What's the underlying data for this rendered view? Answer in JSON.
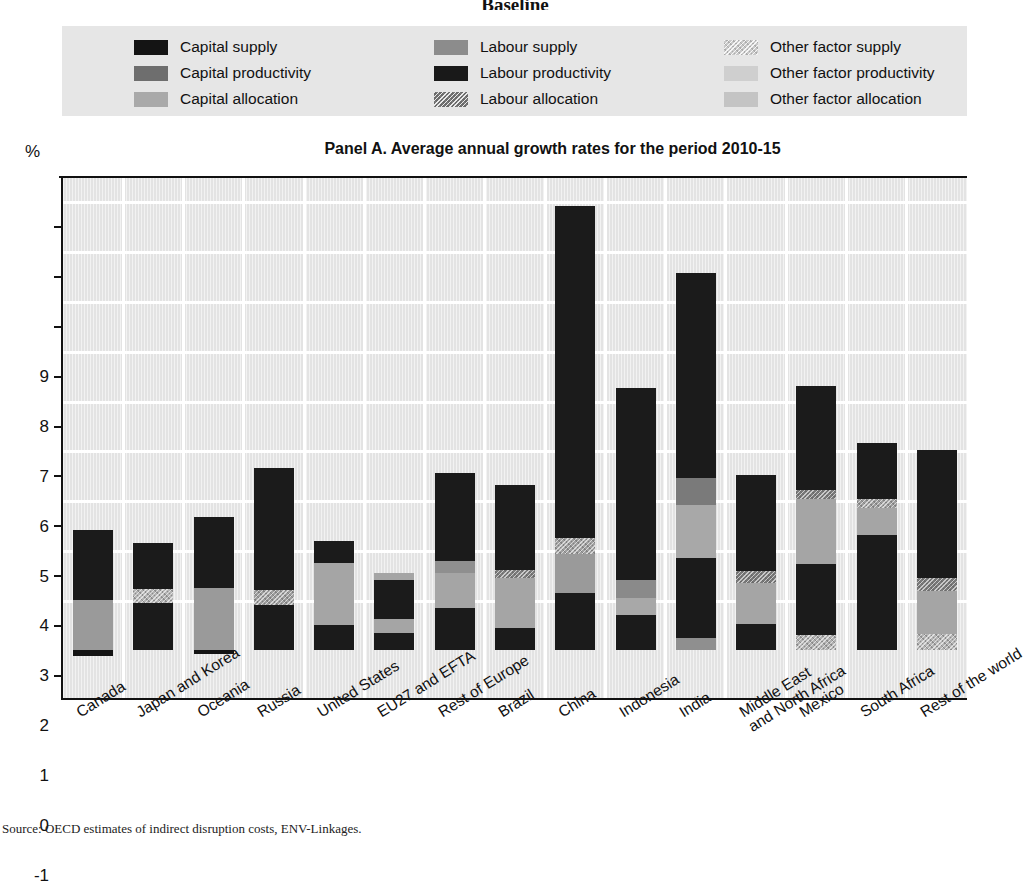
{
  "top_heading": "Baseline",
  "footer_note": "Source: OECD estimates of indirect disruption costs, ENV-Linkages.",
  "axis": {
    "unit_label": "%",
    "y_ticks": [
      9,
      8,
      7,
      6,
      5,
      4,
      3,
      2,
      1,
      0,
      -1
    ]
  },
  "legend": {
    "items": [
      {
        "label": "Capital supply",
        "color": "#141414",
        "texture": "none"
      },
      {
        "label": "Capital productivity",
        "color": "#6e6e6e",
        "texture": "none"
      },
      {
        "label": "Capital allocation",
        "color": "#a9a9a9",
        "texture": "none"
      },
      {
        "label": "Labour supply",
        "color": "#8c8c8c",
        "texture": "none"
      },
      {
        "label": "Labour productivity",
        "color": "#191919",
        "texture": "none"
      },
      {
        "label": "Labour allocation",
        "color": "#6b6b6b",
        "texture": "dots"
      },
      {
        "label": "Other factor supply",
        "color": "#c9c9c9",
        "texture": "dots"
      },
      {
        "label": "Other factor productivity",
        "color": "#cfcfcf",
        "texture": "none"
      },
      {
        "label": "Other factor allocation",
        "color": "#c4c4c4",
        "texture": "none"
      }
    ]
  },
  "chart_data": {
    "type": "bar",
    "stacked": true,
    "title": "Panel A. Average annual growth rates for the period 2010-15",
    "xlabel": "",
    "ylabel": "%",
    "ylim": [
      -1,
      9.5
    ],
    "ytick_step": 1,
    "grid": true,
    "legend_position": "top",
    "categories": [
      "Canada",
      "Japan and Korea",
      "Oceania",
      "Russia",
      "United States",
      "EU27 and EFTA",
      "Rest of Europe",
      "Brazil",
      "China",
      "Indonesia",
      "India",
      "Middle East\nand North Africa",
      "Mexico",
      "South Africa",
      "Rest of the world"
    ],
    "series": [
      {
        "name": "Capital supply",
        "values": [
          1.4,
          0.95,
          1.42,
          0.9,
          0.45,
          0.8,
          1.8,
          1.7,
          6.65,
          3.85,
          4.1,
          1.95,
          2.1,
          1.15,
          2.55
        ]
      },
      {
        "name": "Labour supply",
        "values": [
          1.0,
          0.25,
          1.25,
          0.0,
          1.25,
          0.25,
          0.9,
          1.0,
          1.05,
          0.4,
          1.05,
          0.85,
          1.3,
          0.55,
          0.8
        ]
      },
      {
        "name": "Other factor supply",
        "values": [
          -0.1,
          0.15,
          -0.07,
          0.3,
          0.0,
          0.0,
          0.0,
          0.15,
          0.3,
          0.0,
          0.55,
          0.2,
          0.3,
          0.15,
          0.35
        ]
      },
      {
        "name": "Labour productivity",
        "values": [
          0.0,
          1.05,
          0.0,
          2.45,
          1.75,
          0.35,
          0.85,
          0.45,
          1.15,
          0.7,
          1.6,
          0.5,
          1.45,
          2.3,
          1.45
        ]
      },
      {
        "name": "Capital productivity",
        "values": [
          0.0,
          0.0,
          0.0,
          0.0,
          0.0,
          0.0,
          0.0,
          0.0,
          0.0,
          0.3,
          0.0,
          0.0,
          0.0,
          0.0,
          0.0
        ]
      },
      {
        "name": "Other factor productivity",
        "values": [
          0.0,
          0.0,
          0.0,
          0.0,
          0.0,
          0.15,
          0.0,
          0.0,
          0.0,
          0.0,
          0.25,
          0.0,
          0.15,
          0.0,
          0.0
        ]
      }
    ],
    "bars": [
      {
        "category": "Canada",
        "total": 2.4,
        "segments": [
          {
            "series": "Other factor supply",
            "from": -0.12,
            "to": 0.0,
            "color": "#141414",
            "texture": "none"
          },
          {
            "series": "Labour supply",
            "from": 0.0,
            "to": 1.0,
            "color": "#9a9a9a",
            "texture": "none"
          },
          {
            "series": "Capital supply",
            "from": 1.0,
            "to": 2.4,
            "color": "#1b1b1b",
            "texture": "none"
          }
        ]
      },
      {
        "category": "Japan and Korea",
        "total": 2.15,
        "segments": [
          {
            "series": "Labour productivity",
            "from": 0.0,
            "to": 0.95,
            "color": "#1b1b1b",
            "texture": "none"
          },
          {
            "series": "Other factor supply",
            "from": 0.95,
            "to": 1.22,
            "color": "#b4b4b4",
            "texture": "dots"
          },
          {
            "series": "Capital supply",
            "from": 1.22,
            "to": 2.15,
            "color": "#1b1b1b",
            "texture": "none"
          }
        ]
      },
      {
        "category": "Oceania",
        "total": 2.67,
        "segments": [
          {
            "series": "Other factor supply",
            "from": -0.08,
            "to": 0.0,
            "color": "#141414",
            "texture": "none"
          },
          {
            "series": "Labour supply",
            "from": 0.0,
            "to": 1.25,
            "color": "#9a9a9a",
            "texture": "none"
          },
          {
            "series": "Capital supply",
            "from": 1.25,
            "to": 2.67,
            "color": "#1b1b1b",
            "texture": "none"
          }
        ]
      },
      {
        "category": "Russia",
        "total": 3.65,
        "segments": [
          {
            "series": "Labour productivity",
            "from": 0.0,
            "to": 0.9,
            "color": "#1b1b1b",
            "texture": "none"
          },
          {
            "series": "Other factor supply",
            "from": 0.9,
            "to": 1.2,
            "color": "#9e9e9e",
            "texture": "dots"
          },
          {
            "series": "Capital supply",
            "from": 1.2,
            "to": 3.65,
            "color": "#1b1b1b",
            "texture": "none"
          }
        ]
      },
      {
        "category": "United States",
        "total": 2.18,
        "segments": [
          {
            "series": "Labour productivity",
            "from": 0.0,
            "to": 0.5,
            "color": "#1b1b1b",
            "texture": "none"
          },
          {
            "series": "Labour supply",
            "from": 0.5,
            "to": 1.75,
            "color": "#a5a5a5",
            "texture": "none"
          },
          {
            "series": "Capital supply",
            "from": 1.75,
            "to": 2.18,
            "color": "#1b1b1b",
            "texture": "none"
          }
        ]
      },
      {
        "category": "EU27 and EFTA",
        "total": 1.55,
        "segments": [
          {
            "series": "Labour productivity",
            "from": 0.0,
            "to": 0.35,
            "color": "#1b1b1b",
            "texture": "none"
          },
          {
            "series": "Labour supply",
            "from": 0.35,
            "to": 0.62,
            "color": "#a5a5a5",
            "texture": "none"
          },
          {
            "series": "Capital supply",
            "from": 0.62,
            "to": 1.4,
            "color": "#1b1b1b",
            "texture": "none"
          },
          {
            "series": "Other factor productivity",
            "from": 1.4,
            "to": 1.55,
            "color": "#a5a5a5",
            "texture": "none"
          }
        ]
      },
      {
        "category": "Rest of Europe",
        "total": 3.55,
        "segments": [
          {
            "series": "Labour productivity",
            "from": 0.0,
            "to": 0.85,
            "color": "#1b1b1b",
            "texture": "none"
          },
          {
            "series": "Labour supply",
            "from": 0.85,
            "to": 1.55,
            "color": "#a5a5a5",
            "texture": "none"
          },
          {
            "series": "Capital allocation",
            "from": 1.55,
            "to": 1.78,
            "color": "#8f8f8f",
            "texture": "none"
          },
          {
            "series": "Capital supply",
            "from": 1.78,
            "to": 3.55,
            "color": "#1b1b1b",
            "texture": "none"
          }
        ]
      },
      {
        "category": "Brazil",
        "total": 3.3,
        "segments": [
          {
            "series": "Labour productivity",
            "from": 0.0,
            "to": 0.45,
            "color": "#1b1b1b",
            "texture": "none"
          },
          {
            "series": "Labour supply",
            "from": 0.45,
            "to": 1.45,
            "color": "#a5a5a5",
            "texture": "none"
          },
          {
            "series": "Labour allocation",
            "from": 1.45,
            "to": 1.6,
            "color": "#7d7d7d",
            "texture": "dots"
          },
          {
            "series": "Capital supply",
            "from": 1.6,
            "to": 3.3,
            "color": "#1b1b1b",
            "texture": "none"
          }
        ]
      },
      {
        "category": "China",
        "total": 8.9,
        "segments": [
          {
            "series": "Labour productivity",
            "from": 0.0,
            "to": 1.15,
            "color": "#1b1b1b",
            "texture": "none"
          },
          {
            "series": "Labour supply",
            "from": 1.15,
            "to": 1.93,
            "color": "#9a9a9a",
            "texture": "none"
          },
          {
            "series": "Other factor supply",
            "from": 1.93,
            "to": 2.25,
            "color": "#a0a0a0",
            "texture": "dots"
          },
          {
            "series": "Capital supply",
            "from": 2.25,
            "to": 8.9,
            "color": "#1b1b1b",
            "texture": "none"
          }
        ]
      },
      {
        "category": "Indonesia",
        "total": 5.25,
        "segments": [
          {
            "series": "Labour productivity",
            "from": 0.0,
            "to": 0.7,
            "color": "#1b1b1b",
            "texture": "none"
          },
          {
            "series": "Labour supply",
            "from": 0.7,
            "to": 1.05,
            "color": "#a8a8a8",
            "texture": "none"
          },
          {
            "series": "Capital productivity",
            "from": 1.05,
            "to": 1.4,
            "color": "#8a8a8a",
            "texture": "none"
          },
          {
            "series": "Capital supply",
            "from": 1.4,
            "to": 5.25,
            "color": "#1b1b1b",
            "texture": "none"
          }
        ]
      },
      {
        "category": "India",
        "total": 7.55,
        "segments": [
          {
            "series": "Other factor supply",
            "from": 0.0,
            "to": 0.25,
            "color": "#8f8f8f",
            "texture": "none"
          },
          {
            "series": "Labour productivity",
            "from": 0.25,
            "to": 1.85,
            "color": "#1b1b1b",
            "texture": "none"
          },
          {
            "series": "Other factor productivity",
            "from": 1.85,
            "to": 2.9,
            "color": "#a8a8a8",
            "texture": "none"
          },
          {
            "series": "Labour allocation",
            "from": 2.9,
            "to": 3.45,
            "color": "#7a7a7a",
            "texture": "none"
          },
          {
            "series": "Capital supply",
            "from": 3.45,
            "to": 7.55,
            "color": "#1b1b1b",
            "texture": "none"
          }
        ]
      },
      {
        "category": "Middle East\nand North Africa",
        "total": 3.5,
        "segments": [
          {
            "series": "Labour productivity",
            "from": 0.0,
            "to": 0.52,
            "color": "#1b1b1b",
            "texture": "none"
          },
          {
            "series": "Labour supply",
            "from": 0.52,
            "to": 1.35,
            "color": "#a5a5a5",
            "texture": "none"
          },
          {
            "series": "Labour allocation",
            "from": 1.35,
            "to": 1.58,
            "color": "#787878",
            "texture": "dots"
          },
          {
            "series": "Capital supply",
            "from": 1.58,
            "to": 3.5,
            "color": "#1b1b1b",
            "texture": "none"
          }
        ]
      },
      {
        "category": "Mexico",
        "total": 5.3,
        "segments": [
          {
            "series": "Other factor supply",
            "from": 0.0,
            "to": 0.3,
            "color": "#b0b0b0",
            "texture": "dots"
          },
          {
            "series": "Labour productivity",
            "from": 0.3,
            "to": 1.72,
            "color": "#1b1b1b",
            "texture": "none"
          },
          {
            "series": "Labour supply",
            "from": 1.72,
            "to": 3.02,
            "color": "#a5a5a5",
            "texture": "none"
          },
          {
            "series": "Labour allocation",
            "from": 3.02,
            "to": 3.2,
            "color": "#7a7a7a",
            "texture": "dots"
          },
          {
            "series": "Capital supply",
            "from": 3.2,
            "to": 5.3,
            "color": "#1b1b1b",
            "texture": "none"
          }
        ]
      },
      {
        "category": "South Africa",
        "total": 4.15,
        "segments": [
          {
            "series": "Labour productivity",
            "from": 0.0,
            "to": 2.3,
            "color": "#1b1b1b",
            "texture": "none"
          },
          {
            "series": "Labour supply",
            "from": 2.3,
            "to": 2.85,
            "color": "#a5a5a5",
            "texture": "none"
          },
          {
            "series": "Other factor supply",
            "from": 2.85,
            "to": 3.02,
            "color": "#9e9e9e",
            "texture": "dots"
          },
          {
            "series": "Capital supply",
            "from": 3.02,
            "to": 4.15,
            "color": "#1b1b1b",
            "texture": "none"
          }
        ]
      },
      {
        "category": "Rest of the world",
        "total": 4.0,
        "segments": [
          {
            "series": "Other factor supply",
            "from": 0.0,
            "to": 0.33,
            "color": "#b4b4b4",
            "texture": "dots"
          },
          {
            "series": "Labour supply",
            "from": 0.33,
            "to": 1.18,
            "color": "#a5a5a5",
            "texture": "none"
          },
          {
            "series": "Labour allocation",
            "from": 1.18,
            "to": 1.45,
            "color": "#7a7a7a",
            "texture": "dots"
          },
          {
            "series": "Capital supply",
            "from": 1.45,
            "to": 4.0,
            "color": "#1b1b1b",
            "texture": "none"
          }
        ]
      }
    ]
  }
}
